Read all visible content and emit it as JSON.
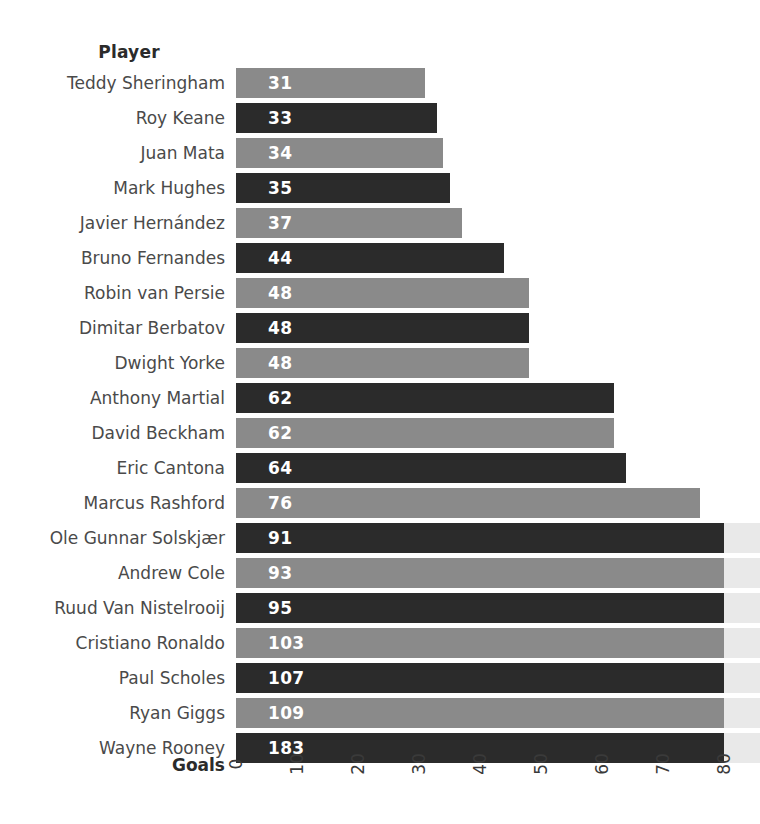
{
  "header": {
    "column_title": "Player"
  },
  "axis": {
    "title": "Goals",
    "ticks": [
      "0",
      "10",
      "20",
      "30",
      "40",
      "50",
      "60",
      "70",
      "80"
    ]
  },
  "colors": {
    "bar_light": "#8a8a8a",
    "bar_dark": "#2b2b2b",
    "bar_overflow": "#e9e9e9",
    "label_text": "#4a4a4a",
    "value_text": "#ffffff",
    "background": "#ffffff"
  },
  "chart_data": {
    "type": "bar",
    "orientation": "horizontal",
    "title": "",
    "xlabel": "Goals",
    "ylabel": "Player",
    "xlim": [
      0,
      80
    ],
    "xticks": [
      0,
      10,
      20,
      30,
      40,
      50,
      60,
      70,
      80
    ],
    "grid": false,
    "legend": null,
    "note": "Bars for values above 80 are clipped at the axis maximum and continue as a light grey band.",
    "categories": [
      "Teddy Sheringham",
      "Roy Keane",
      "Juan Mata",
      "Mark Hughes",
      "Javier Hernández",
      "Bruno Fernandes",
      "Robin van Persie",
      "Dimitar Berbatov",
      "Dwight Yorke",
      "Anthony Martial",
      "David Beckham",
      "Eric Cantona",
      "Marcus Rashford",
      "Ole Gunnar Solskjær",
      "Andrew Cole",
      "Ruud Van Nistelrooij",
      "Cristiano Ronaldo",
      "Paul Scholes",
      "Ryan Giggs",
      "Wayne Rooney"
    ],
    "values": [
      31,
      33,
      34,
      35,
      37,
      44,
      48,
      48,
      48,
      62,
      62,
      64,
      76,
      91,
      93,
      95,
      103,
      107,
      109,
      183
    ],
    "bar_colors": [
      "light",
      "dark",
      "light",
      "dark",
      "light",
      "dark",
      "light",
      "dark",
      "light",
      "dark",
      "light",
      "dark",
      "light",
      "dark",
      "light",
      "dark",
      "light",
      "dark",
      "light",
      "dark"
    ]
  }
}
